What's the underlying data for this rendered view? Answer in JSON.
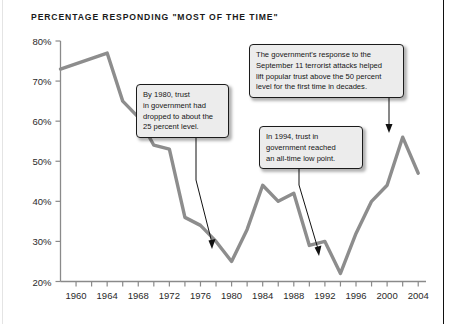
{
  "chart_data": {
    "type": "line",
    "title": "PERCENTAGE RESPONDING \"MOST OF THE TIME\"",
    "xlabel": "",
    "ylabel": "",
    "xlim": [
      1958,
      2005
    ],
    "ylim": [
      20,
      80
    ],
    "grid": false,
    "legend": "none",
    "line_color": "#8d8d8d",
    "ytick_labels": [
      "80%",
      "70%",
      "60%",
      "50%",
      "40%",
      "30%",
      "20%"
    ],
    "ytick_values": [
      80,
      70,
      60,
      50,
      40,
      30,
      20
    ],
    "xtick_labels": [
      "1960",
      "1964",
      "1968",
      "1972",
      "1976",
      "1980",
      "1984",
      "1988",
      "1992",
      "1996",
      "2000",
      "2004"
    ],
    "xtick_values": [
      1960,
      1964,
      1968,
      1972,
      1976,
      1980,
      1984,
      1988,
      1992,
      1996,
      2000,
      2004
    ],
    "minor_xtick_values": [
      1958,
      1962,
      1966,
      1970,
      1974,
      1978,
      1982,
      1986,
      1990,
      1994,
      1998,
      2002
    ],
    "series": [
      {
        "name": "Trust in government — most of the time",
        "x": [
          1958,
          1964,
          1966,
          1968,
          1970,
          1972,
          1974,
          1976,
          1978,
          1980,
          1982,
          1984,
          1986,
          1988,
          1990,
          1992,
          1994,
          1996,
          1998,
          2000,
          2002,
          2004
        ],
        "values": [
          73,
          77,
          65,
          61,
          54,
          53,
          36,
          34,
          30,
          25,
          33,
          44,
          40,
          42,
          29,
          30,
          22,
          32,
          40,
          44,
          56,
          47
        ]
      }
    ],
    "annotations": [
      {
        "id": "annotation-1980",
        "text": "By 1980, trust in government had dropped to about the 25 percent level.",
        "target_year": 1980,
        "target_value": 27
      },
      {
        "id": "annotation-sept11",
        "text": "The government's response to the September 11 terrorist attacks helped lift popular trust above the 50 percent level for the first time in decades.",
        "target_year": 2002,
        "target_value": 57
      },
      {
        "id": "annotation-1994",
        "text": "In 1994, trust in government reached an all-time low point.",
        "target_year": 1994,
        "target_value": 24
      }
    ]
  },
  "annotation_lines": {
    "a1980": [
      "By 1980, trust",
      "in government had",
      "dropped to about the",
      "25 percent level."
    ],
    "asept11": [
      "The government's response to the",
      "September 11 terrorist attacks helped",
      "lift popular trust above the 50 percent",
      "level for the first time in decades."
    ],
    "a1994": [
      "In 1994, trust in",
      "government reached",
      "an all-time low point."
    ]
  }
}
